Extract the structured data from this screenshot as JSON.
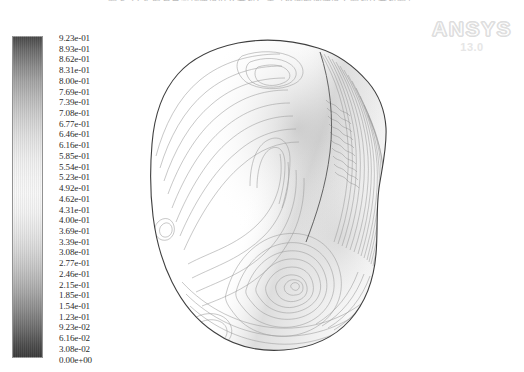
{
  "caption": {
    "text": "图 5-22   扩散室总流场速度/0.9 分析结果（不同截面速度云图对比分析图）"
  },
  "watermark": {
    "brand": "ANSYS",
    "version": "13.0"
  },
  "colorbar": {
    "name": "contour-colorbar",
    "orientation": "vertical",
    "colormap": "grayscale",
    "top_color": "#4a4a4a",
    "mid_color": "#f8f8f8",
    "bottom_color": "#3b3b3b",
    "min_label": "0.00e+00",
    "max_label": "9.23e-01",
    "labels": [
      "9.23e-01",
      "8.93e-01",
      "8.62e-01",
      "8.31e-01",
      "8.00e-01",
      "7.69e-01",
      "7.39e-01",
      "7.08e-01",
      "6.77e-01",
      "6.46e-01",
      "6.16e-01",
      "5.85e-01",
      "5.54e-01",
      "5.23e-01",
      "4.92e-01",
      "4.62e-01",
      "4.31e-01",
      "4.00e-01",
      "3.69e-01",
      "3.39e-01",
      "3.08e-01",
      "2.77e-01",
      "2.46e-01",
      "2.15e-01",
      "1.85e-01",
      "1.54e-01",
      "1.23e-01",
      "9.23e-02",
      "6.16e-02",
      "3.08e-02",
      "0.00e+00"
    ]
  },
  "chart_data": {
    "type": "heatmap",
    "title": "",
    "xlabel": "",
    "ylabel": "",
    "legend_position": "left",
    "grid": false,
    "colorbar_min": 0.0,
    "colorbar_max": 0.923,
    "levels": [
      0.0,
      0.0308,
      0.0616,
      0.0923,
      0.123,
      0.154,
      0.185,
      0.215,
      0.246,
      0.277,
      0.308,
      0.339,
      0.369,
      0.4,
      0.431,
      0.462,
      0.492,
      0.523,
      0.554,
      0.585,
      0.616,
      0.646,
      0.677,
      0.708,
      0.739,
      0.769,
      0.8,
      0.831,
      0.862,
      0.893,
      0.923
    ],
    "level_count": 31,
    "level_step": 0.0308,
    "units": "m/s"
  }
}
